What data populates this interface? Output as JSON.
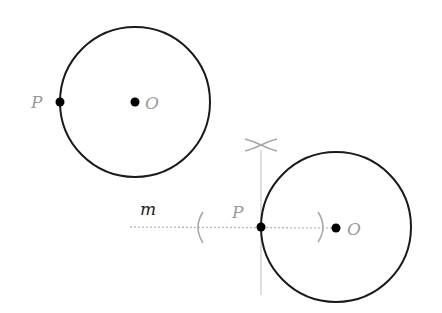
{
  "diagram": {
    "colors": {
      "circle": "#1a1a1a",
      "construction": "#b8b8b8",
      "label": "#9a9a9a",
      "point": "#000000"
    },
    "figure_1": {
      "circle": {
        "cx": 135,
        "cy": 102,
        "r": 75
      },
      "center_label": "O",
      "point_label": "P"
    },
    "figure_2": {
      "circle": {
        "cx": 336,
        "cy": 227,
        "r": 75
      },
      "center_label": "O",
      "point_label": "P",
      "line_label": "m",
      "perpendicular_mark": "×"
    }
  }
}
